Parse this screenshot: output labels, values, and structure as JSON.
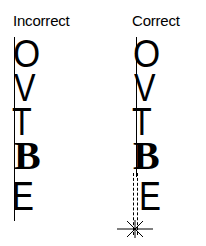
{
  "diagram": {
    "columns": [
      {
        "id": "incorrect",
        "label": "Incorrect",
        "letters": [
          "O",
          "V",
          "T",
          "B",
          "E"
        ],
        "alignment_line": "solid"
      },
      {
        "id": "correct",
        "label": "Correct",
        "letters": [
          "O",
          "V",
          "T",
          "B",
          "E"
        ],
        "alignment_line": "solid-then-dashed",
        "marker": "asterisk"
      }
    ],
    "letter_styles": {
      "O": "sans",
      "V": "sans",
      "T": "sans",
      "B": "bold-serif",
      "E": "sans"
    },
    "colors": {
      "ink": "#000000",
      "background": "#ffffff"
    }
  }
}
